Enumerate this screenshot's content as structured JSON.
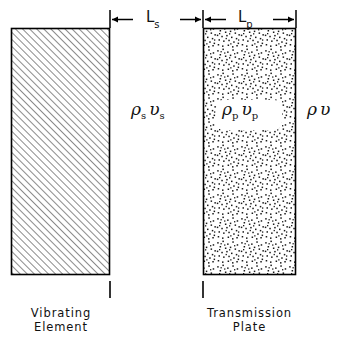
{
  "figure": {
    "background_color": "#ffffff",
    "ink_color": "#000000"
  },
  "dimensions": [
    {
      "id": "Ls",
      "label_base": "L",
      "label_sub": "s",
      "description": "separation between vibrating element and transmission plate"
    },
    {
      "id": "Lp",
      "label_base": "L",
      "label_sub": "p",
      "description": "thickness of transmission plate"
    }
  ],
  "symbols": [
    {
      "id": "source-medium",
      "rho": "ρ",
      "rho_sub": "s",
      "v": "υ",
      "v_sub": "s"
    },
    {
      "id": "plate-medium",
      "rho": "ρ",
      "rho_sub": "p",
      "v": "υ",
      "v_sub": "p"
    },
    {
      "id": "far-medium",
      "rho": "ρ",
      "rho_sub": "",
      "v": "υ",
      "v_sub": ""
    }
  ],
  "blocks": [
    {
      "id": "vibrating-element",
      "fill": "diagonal-hatch",
      "caption_line1": "Vibrating",
      "caption_line2": "Element"
    },
    {
      "id": "transmission-plate",
      "fill": "stipple",
      "caption_line1": "Transmission",
      "caption_line2": "Plate"
    }
  ]
}
